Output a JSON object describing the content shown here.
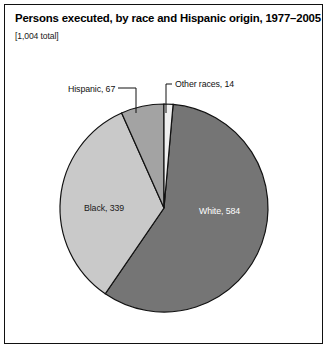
{
  "figure": {
    "title": "Persons executed, by race and Hispanic origin, 1977–2005",
    "subtitle": "[1,004 total]",
    "frame_color": "#111111",
    "background": "#ffffff"
  },
  "chart_data": {
    "type": "pie",
    "title": "Persons executed, by race and Hispanic origin, 1977–2005",
    "subtitle": "[1,004 total]",
    "total": 1004,
    "unit": "persons executed",
    "period": "1977–2005",
    "start_angle_deg": 0,
    "direction": "clockwise",
    "legend": "none",
    "grid": false,
    "categories": [
      "Other races",
      "White",
      "Black",
      "Hispanic"
    ],
    "values": [
      14,
      584,
      339,
      67
    ],
    "slices": [
      {
        "name": "Other races",
        "label": "Other races, 14",
        "value": 14,
        "percent": 1.4,
        "color": "#efefef",
        "label_style": "callout",
        "label_position": "top-right"
      },
      {
        "name": "White",
        "label": "White, 584",
        "value": 584,
        "percent": 58.2,
        "color": "#757575",
        "label_style": "inside",
        "label_color": "#ffffff"
      },
      {
        "name": "Black",
        "label": "Black, 339",
        "value": 339,
        "percent": 33.8,
        "color": "#c9c9c9",
        "label_style": "inside",
        "label_color": "#1a1a1a"
      },
      {
        "name": "Hispanic",
        "label": "Hispanic, 67",
        "value": 67,
        "percent": 6.7,
        "color": "#a3a3a3",
        "label_style": "callout",
        "label_position": "top-left"
      }
    ],
    "labels": {
      "black": "Black, 339",
      "white": "White, 584",
      "hispanic": "Hispanic, 67",
      "other_races": "Other races, 14"
    }
  }
}
